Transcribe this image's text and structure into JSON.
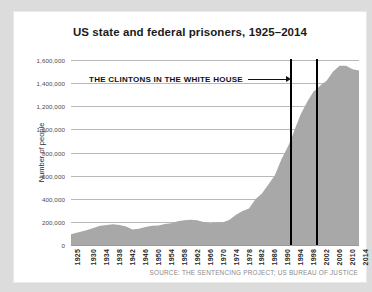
{
  "chart_data": {
    "type": "area",
    "title": "US state and federal prisoners, 1925–2014",
    "xlabel": "",
    "ylabel": "Number of people",
    "ylim": [
      0,
      1600000
    ],
    "xlim": [
      1925,
      2014
    ],
    "grid": true,
    "legend": "none",
    "series_color": "#a8a8a8",
    "ytick_labels": [
      "1,600,000",
      "1,400,000",
      "1,200,000",
      "1,000,000",
      "800,000",
      "600,000",
      "400,000",
      "200,000",
      "0"
    ],
    "ytick_values": [
      1600000,
      1400000,
      1200000,
      1000000,
      800000,
      600000,
      400000,
      200000,
      0
    ],
    "xtick_labels": [
      "1925",
      "1930",
      "1934",
      "1938",
      "1942",
      "1946",
      "1950",
      "1954",
      "1958",
      "1962",
      "1966",
      "1970",
      "1974",
      "1978",
      "1982",
      "1986",
      "1990",
      "1994",
      "1998",
      "2002",
      "2006",
      "2010",
      "2014"
    ],
    "xtick_values": [
      1925,
      1930,
      1934,
      1938,
      1942,
      1946,
      1950,
      1954,
      1958,
      1962,
      1966,
      1970,
      1974,
      1978,
      1982,
      1986,
      1990,
      1994,
      1998,
      2002,
      2006,
      2010,
      2014
    ],
    "x": [
      1925,
      1930,
      1934,
      1938,
      1940,
      1942,
      1944,
      1946,
      1948,
      1950,
      1952,
      1954,
      1956,
      1958,
      1960,
      1962,
      1964,
      1966,
      1968,
      1970,
      1972,
      1974,
      1976,
      1978,
      1980,
      1982,
      1984,
      1986,
      1988,
      1990,
      1992,
      1993,
      1994,
      1996,
      1998,
      2000,
      2001,
      2002,
      2004,
      2006,
      2008,
      2010,
      2012,
      2014
    ],
    "values": [
      92000,
      129000,
      167000,
      179000,
      174000,
      160000,
      133000,
      141000,
      155000,
      166000,
      169000,
      182000,
      189000,
      205000,
      213000,
      218000,
      215000,
      200000,
      188000,
      196000,
      196000,
      218000,
      262000,
      294000,
      316000,
      395000,
      445000,
      523000,
      604000,
      740000,
      850000,
      910000,
      990000,
      1130000,
      1240000,
      1330000,
      1350000,
      1380000,
      1420000,
      1500000,
      1550000,
      1550000,
      1520000,
      1510000
    ],
    "annotations": [
      {
        "text": "THE CLINTONS IN THE WHITE HOUSE",
        "arrow": "right",
        "points_to": 1993
      }
    ],
    "marker_lines": [
      {
        "x": 1993,
        "color": "#000000"
      },
      {
        "x": 2001,
        "color": "#000000"
      }
    ],
    "source": "SOURCE: THE SENTENCING PROJECT; US BUREAU OF JUSTICE"
  }
}
